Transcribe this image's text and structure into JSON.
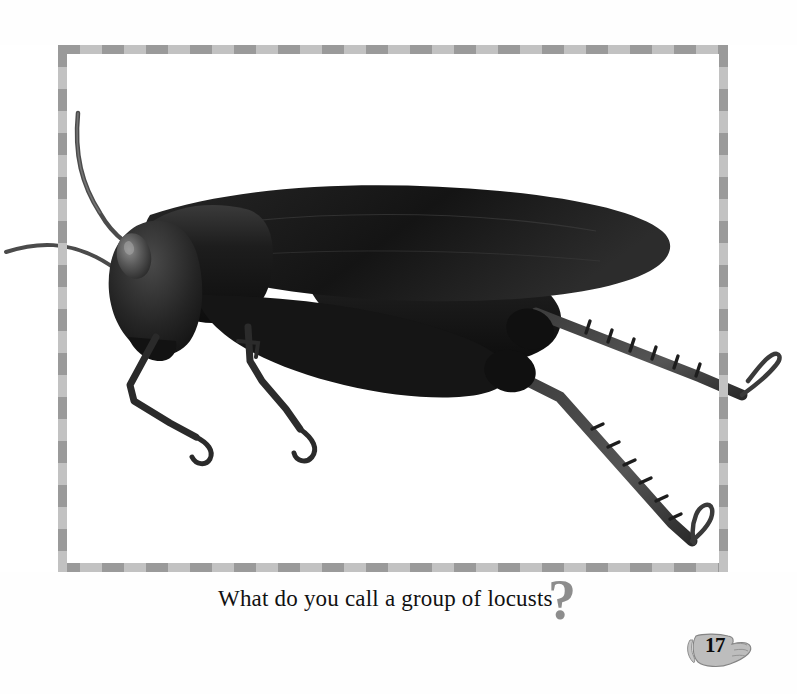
{
  "page": {
    "background_color": "#fefefe",
    "page_number": "17"
  },
  "photo": {
    "alt_name": "locust-photograph",
    "subject": "locust",
    "style": "black-and-white photograph",
    "background_color": "#ffffff",
    "body_color": "#1b1b1b"
  },
  "frame": {
    "name": "checkered-photo-border",
    "dark_color": "#9a9a9a",
    "light_color": "#c2c2c2",
    "segment_px": 22
  },
  "caption": {
    "text": "What do you call a group of locusts",
    "question_mark": "?",
    "question_mark_color": "#8d8d8d",
    "text_color": "#111111"
  },
  "badge": {
    "icon_name": "pointing-hand-icon",
    "number": "17",
    "fill_color": "#b8b8b8",
    "stroke_color": "#6f6f6f"
  }
}
